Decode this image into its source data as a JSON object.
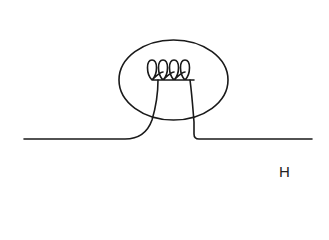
{
  "diagram": {
    "label": "H",
    "stroke_color": "#1a1a1a",
    "background_color": "#ffffff"
  }
}
